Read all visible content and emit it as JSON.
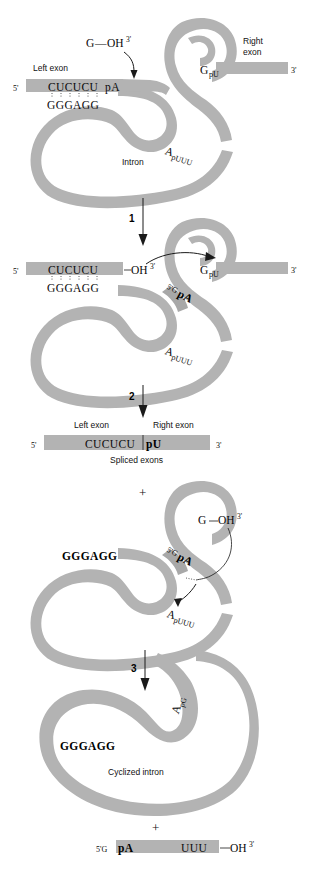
{
  "figure": {
    "type": "group-I-intron-self-splicing-mechanism",
    "background": "#ffffff",
    "ribbon_color": "#b3b3b3",
    "ink_color": "#111111"
  },
  "panels": [
    {
      "id": "panel-precursor",
      "labels": {
        "left_exon": "Left exon",
        "right_exon_line1": "Right",
        "right_exon_line2": "exon",
        "intron": "Intron",
        "five_prime": "5'",
        "three_prime": "3'"
      },
      "sequences": {
        "exon_internal_guide": "CUCUCU",
        "splice_site_5": "pA",
        "guide_sequence": "GGGAGG",
        "three_splice_site_G": "G",
        "three_splice_site_pU": "pU",
        "branch_A": "A",
        "branch_pUUU": "pUUU"
      },
      "cofactor": {
        "base": "G",
        "link": "—",
        "hydroxyl": "OH",
        "prime": "3'"
      }
    },
    {
      "id": "step-1-arrow",
      "number": "1"
    },
    {
      "id": "panel-after-first-transesterification",
      "labels": {
        "five_prime": "5'",
        "three_prime": "3'"
      },
      "sequences": {
        "exon_internal_guide": "CUCUCU",
        "free_hydroxyl": "OH",
        "free_hydroxyl_prime": "3'",
        "guide_sequence": "GGGAGG",
        "g_added_5prime": "5'G",
        "g_added_pA": "pA",
        "three_splice_site_G": "G",
        "three_splice_site_pU": "pU",
        "branch_A": "A",
        "branch_pUUU": "pUUU"
      }
    },
    {
      "id": "step-2-arrow",
      "number": "2"
    },
    {
      "id": "panel-spliced-exons",
      "labels": {
        "left_exon": "Left exon",
        "right_exon": "Right exon",
        "caption": "Spliced exons",
        "five_prime": "5'",
        "three_prime": "3'"
      },
      "sequences": {
        "left": "CUCUCU",
        "right": "pU"
      },
      "plus_sign": "+"
    },
    {
      "id": "panel-excised-linear-intron",
      "sequences": {
        "guide_sequence": "GGGAGG",
        "g_added_5prime": "5'G",
        "g_added_pA": "pA",
        "terminal_G": "G",
        "terminal_hydroxyl": "OH",
        "terminal_prime": "3'",
        "branch_A": "A",
        "branch_pUUU": "pUUU"
      },
      "cofactor": {
        "link": "—"
      }
    },
    {
      "id": "step-3-arrow",
      "number": "3"
    },
    {
      "id": "panel-cyclized-intron",
      "labels": {
        "caption": "Cyclized intron"
      },
      "sequences": {
        "guide_sequence": "GGGAGG",
        "junction_A": "A",
        "junction_pG": "pG"
      },
      "plus_sign": "+"
    },
    {
      "id": "panel-released-oligonucleotide",
      "sequences": {
        "five_prime_G": "5'G",
        "pA": "pA",
        "UUU": "UUU",
        "link": "—",
        "hydroxyl": "OH",
        "prime": "3'"
      }
    }
  ]
}
